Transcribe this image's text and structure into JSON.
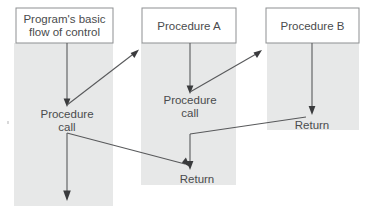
{
  "diagram": {
    "type": "flow-of-control-diagram",
    "background_color": "#ffffff",
    "lane_color": "#e7e8e8",
    "box_fill": "#ffffff",
    "box_stroke": "#8d8f91",
    "line_color": "#58595b",
    "text_color": "#4a4b4d",
    "lanes": [
      {
        "name": "program-lane",
        "x": 14,
        "y": 43,
        "width": 99,
        "height": 163
      },
      {
        "name": "procedure-a-lane",
        "x": 141,
        "y": 43,
        "width": 95,
        "height": 142
      },
      {
        "name": "procedure-b-lane",
        "x": 267,
        "y": 43,
        "width": 92,
        "height": 87
      }
    ],
    "boxes": [
      {
        "name": "program-box",
        "line1": "Program's basic",
        "line2": "flow of control",
        "x": 16,
        "y": 8,
        "width": 97,
        "height": 35
      },
      {
        "name": "procedure-a-box",
        "line1": "Procedure A",
        "line2": "",
        "x": 142,
        "y": 8,
        "width": 94,
        "height": 35
      },
      {
        "name": "procedure-b-box",
        "line1": "Procedure B",
        "line2": "",
        "x": 266,
        "y": 8,
        "width": 93,
        "height": 35
      }
    ],
    "labels": [
      {
        "name": "program-procedure-call-label",
        "line1": "Procedure",
        "line2": "call",
        "x": 67,
        "y": 118
      },
      {
        "name": "procedure-a-call-label",
        "line1": "Procedure",
        "line2": "call",
        "x": 190,
        "y": 104
      },
      {
        "name": "procedure-a-return-label",
        "line1": "Return",
        "line2": "",
        "x": 197,
        "y": 180
      },
      {
        "name": "procedure-b-return-label",
        "line1": "Return",
        "line2": "",
        "x": 312,
        "y": 125
      }
    ],
    "flows": [
      {
        "name": "program-entry-flow",
        "from": "program-box",
        "to": "program-procedure-call-label"
      },
      {
        "name": "call-a-flow",
        "from": "program-procedure-call-label",
        "to": "procedure-a-box"
      },
      {
        "name": "procedure-a-entry-flow",
        "from": "procedure-a-box",
        "to": "procedure-a-call-label"
      },
      {
        "name": "call-b-flow",
        "from": "procedure-a-call-label",
        "to": "procedure-b-box"
      },
      {
        "name": "procedure-b-entry-flow",
        "from": "procedure-b-box",
        "to": "procedure-b-return-label"
      },
      {
        "name": "return-to-a-flow",
        "from": "procedure-b-return-label",
        "to": "procedure-a-call-label"
      },
      {
        "name": "procedure-a-resume-flow",
        "from": "procedure-a-call-label",
        "to": "procedure-a-return-label"
      },
      {
        "name": "return-to-program-flow",
        "from": "procedure-a-return-label",
        "to": "program-procedure-call-label"
      },
      {
        "name": "program-continue-flow",
        "from": "program-procedure-call-label",
        "to": "program-end"
      }
    ]
  }
}
